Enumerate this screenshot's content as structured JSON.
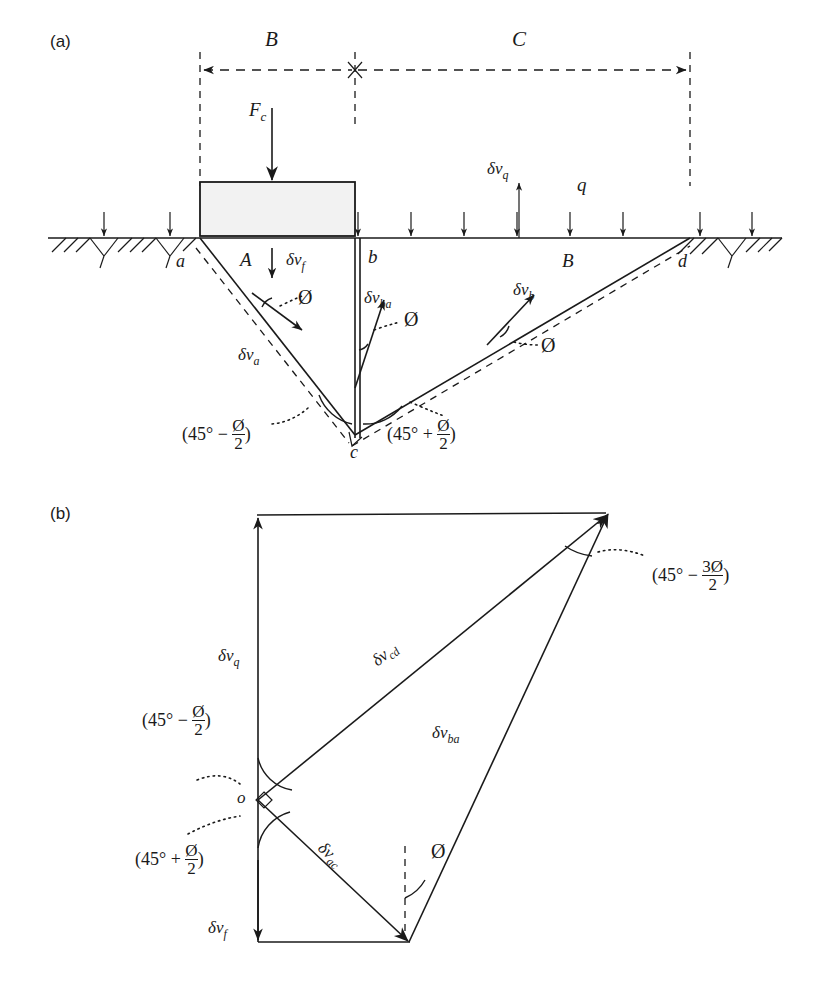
{
  "figure": {
    "panels": [
      {
        "id": "a",
        "label": "(a)",
        "caption_kind": "failure-mechanism"
      },
      {
        "id": "b",
        "label": "(b)",
        "caption_kind": "hodograph"
      }
    ]
  },
  "panel_a": {
    "label": "(a)",
    "dimensions": [
      {
        "name": "B",
        "label": "B",
        "span": "footing-width"
      },
      {
        "name": "C",
        "label": "C",
        "span": "passive-zone-width"
      }
    ],
    "loads": {
      "footing_load": "F",
      "footing_load_sub": "c",
      "surcharge": "q"
    },
    "velocities": [
      {
        "name": "dv-f",
        "sym": "δν",
        "sub": "f"
      },
      {
        "name": "dv-a",
        "sym": "δν",
        "sub": "a"
      },
      {
        "name": "dv-b",
        "sym": "δν",
        "sub": "b"
      },
      {
        "name": "dv-ba",
        "sym": "δν",
        "sub": "ba"
      },
      {
        "name": "dv-q",
        "sym": "δν",
        "sub": "q"
      }
    ],
    "points": [
      {
        "name": "a",
        "label": "a"
      },
      {
        "name": "b",
        "label": "b"
      },
      {
        "name": "c",
        "label": "c"
      },
      {
        "name": "d",
        "label": "d"
      }
    ],
    "zones": [
      {
        "name": "zone-A",
        "label": "A"
      },
      {
        "name": "zone-B",
        "label": "B"
      }
    ],
    "friction_angles": [
      {
        "name": "phi-a",
        "label": "Ø"
      },
      {
        "name": "phi-ba",
        "label": "Ø"
      },
      {
        "name": "phi-b",
        "label": "Ø"
      }
    ],
    "wedge_angles": [
      {
        "name": "angle-45-minus",
        "open": "(45°",
        "op": "−",
        "num": "Ø",
        "den": "2",
        "close": ")"
      },
      {
        "name": "angle-45-plus",
        "open": "(45°",
        "op": "+",
        "num": "Ø",
        "den": "2",
        "close": ")"
      }
    ]
  },
  "panel_b": {
    "label": "(b)",
    "origin_label": "o",
    "velocities": [
      {
        "name": "dv-q",
        "sym": "δν",
        "sub": "q"
      },
      {
        "name": "dv-cd",
        "sym": "δν",
        "sub": "cd"
      },
      {
        "name": "dv-ba",
        "sym": "δν",
        "sub": "ba"
      },
      {
        "name": "dv-ac",
        "sym": "δν",
        "sub": "ac"
      },
      {
        "name": "dv-f",
        "sym": "δν",
        "sub": "f"
      }
    ],
    "friction_angle": "Ø",
    "angles": [
      {
        "name": "angle-45-minus-3phi-2",
        "open": "(45°",
        "op": "−",
        "num": "3Ø",
        "den": "2",
        "close": ")"
      },
      {
        "name": "angle-45-minus-phi-2",
        "open": "(45°",
        "op": "−",
        "num": "Ø",
        "den": "2",
        "close": ")"
      },
      {
        "name": "angle-45-plus-phi-2",
        "open": "(45°",
        "op": "+",
        "num": "Ø",
        "den": "2",
        "close": ")"
      }
    ]
  },
  "colors": {
    "ink": "#1a1a1a",
    "footing_fill": "#f2f2f2",
    "background": "#ffffff"
  }
}
